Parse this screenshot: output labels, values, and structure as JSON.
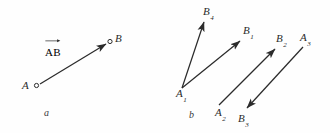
{
  "figure": {
    "background_color": "#fefefe",
    "ink_color": "#2b2b2b",
    "panels": [
      {
        "id": "a",
        "label": "a"
      },
      {
        "id": "b",
        "label": "b"
      }
    ],
    "panel_a": {
      "label": "a",
      "vector_label": "AB",
      "vector_label_accent": "right-arrow-overbar",
      "points": [
        {
          "name": "A",
          "label": "A",
          "marker": "open-circle",
          "x": 36,
          "y": 85
        },
        {
          "name": "B",
          "label": "B",
          "marker": "open-circle",
          "x": 110,
          "y": 42
        }
      ],
      "arrows": [
        {
          "from": "A",
          "to": "B",
          "x1": 40,
          "y1": 84,
          "x2": 106,
          "y2": 44,
          "arrowhead": "end"
        }
      ]
    },
    "panel_b": {
      "label": "b",
      "points": [
        {
          "name": "A1",
          "base": "A",
          "sub": "1",
          "x": 183,
          "y": 92
        },
        {
          "name": "A2",
          "base": "A",
          "sub": "2",
          "x": 222,
          "y": 111
        },
        {
          "name": "A3",
          "base": "A",
          "sub": "3",
          "x": 306,
          "y": 36
        },
        {
          "name": "B1",
          "base": "B",
          "sub": "1",
          "x": 249,
          "y": 29
        },
        {
          "name": "B2",
          "base": "B",
          "sub": "2",
          "x": 281,
          "y": 37
        },
        {
          "name": "B3",
          "base": "B",
          "sub": "3",
          "x": 244,
          "y": 119
        },
        {
          "name": "B4",
          "base": "B",
          "sub": "4",
          "x": 209,
          "y": 12
        }
      ],
      "vectors": [
        {
          "name": "A1B4",
          "from": "A1",
          "to": "B4",
          "x1": 182,
          "y1": 88,
          "x2": 204,
          "y2": 22,
          "arrowhead": "end"
        },
        {
          "name": "A1B1",
          "from": "A1",
          "to": "B1",
          "x1": 182,
          "y1": 88,
          "x2": 240,
          "y2": 41,
          "arrowhead": "end"
        },
        {
          "name": "A2B2",
          "from": "A2",
          "to": "B2",
          "x1": 219,
          "y1": 105,
          "x2": 275,
          "y2": 49,
          "arrowhead": "end"
        },
        {
          "name": "A3B3",
          "from": "A3",
          "to": "B3",
          "x1": 303,
          "y1": 47,
          "x2": 247,
          "y2": 108,
          "arrowhead": "end"
        }
      ]
    }
  }
}
